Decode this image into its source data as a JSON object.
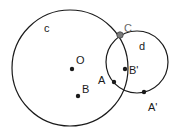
{
  "diagram": {
    "type": "geometry-construction",
    "circles": [
      {
        "id": "c",
        "label": "c",
        "cx": 70,
        "cy": 68,
        "r": 58
      },
      {
        "id": "d",
        "label": "d",
        "cx": 137,
        "cy": 62,
        "r": 31
      }
    ],
    "points": [
      {
        "id": "O",
        "label": "O",
        "x": 72,
        "y": 69
      },
      {
        "id": "B",
        "label": "B",
        "x": 78,
        "y": 96
      },
      {
        "id": "A",
        "label": "A",
        "x": 114,
        "y": 82
      },
      {
        "id": "Bp",
        "label": "B'",
        "x": 125,
        "y": 69
      },
      {
        "id": "Ap",
        "label": "A'",
        "x": 144,
        "y": 92
      },
      {
        "id": "C",
        "label": "C",
        "x": 120,
        "y": 35
      }
    ],
    "colors": {
      "stroke": "#1a1a1a",
      "highlight_point": "#7a7a7a",
      "label_C": "#666666"
    }
  }
}
